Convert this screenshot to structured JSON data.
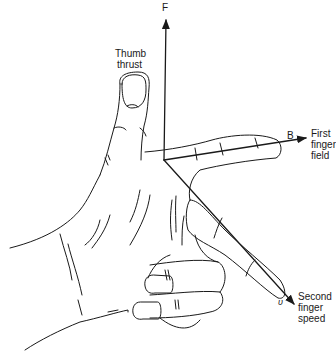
{
  "diagram": {
    "axes": [
      {
        "id": "F",
        "symbol": "F",
        "description": [
          "Thumb",
          "thrust"
        ]
      },
      {
        "id": "B",
        "symbol": "B",
        "description": [
          "First",
          "finger",
          "field"
        ]
      },
      {
        "id": "v",
        "symbol": "υ",
        "description": [
          "Second",
          "finger",
          "speed"
        ]
      }
    ],
    "labels": {
      "force_symbol": "F",
      "thumb_line1": "Thumb",
      "thumb_line2": "thrust",
      "field_symbol": "B",
      "first_line1": "First",
      "first_line2": "finger",
      "first_line3": "field",
      "speed_symbol": "υ",
      "second_line1": "Second",
      "second_line2": "finger",
      "second_line3": "speed"
    },
    "colors": {
      "ink": "#1a1a1a",
      "background": "#ffffff"
    }
  }
}
